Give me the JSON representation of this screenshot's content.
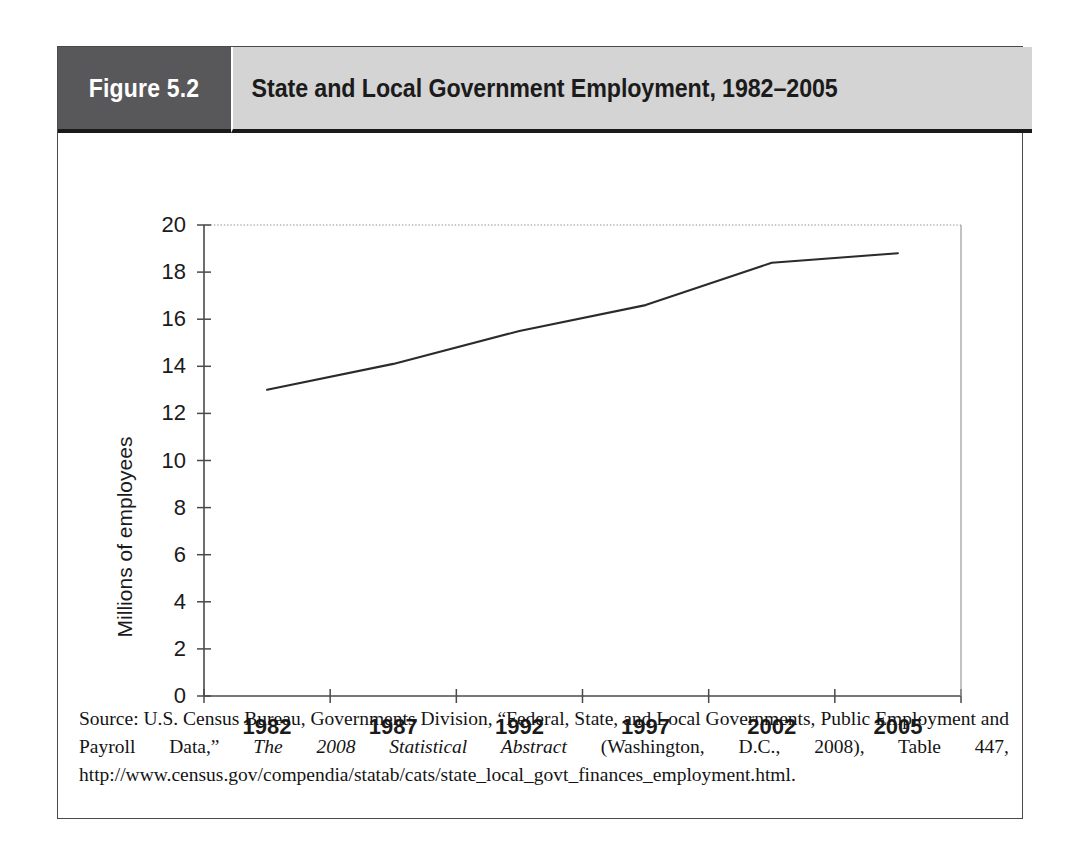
{
  "figure": {
    "number_label": "Figure 5.2",
    "title": "State and Local Government Employment, 1982–2005",
    "number_box_color": "#58585a",
    "title_box_color": "#d4d4d4",
    "frame_color": "#4a4a4a"
  },
  "source": {
    "prefix": "Source: U.S. Census Bureau, Governments Division, “Federal, State, and Local Governments, Public Employment and Payroll Data,” ",
    "italic_title": "The 2008 Statistical Abstract",
    "suffix": " (Washington, D.C., 2008), Table 447, http://www.census.gov/compendia/statab/cats/state_local_govt_finances_employment.html."
  },
  "chart_data": {
    "type": "line",
    "title": "State and Local Government Employment, 1982–2005",
    "xlabel": "",
    "ylabel": "Millions of employees",
    "ylim": [
      0,
      20
    ],
    "ytick_step": 2,
    "yticks": [
      "0",
      "2",
      "4",
      "6",
      "8",
      "10",
      "12",
      "14",
      "16",
      "18",
      "20"
    ],
    "categories": [
      "1982",
      "1987",
      "1992",
      "1997",
      "2002",
      "2005"
    ],
    "x": [
      1982,
      1987,
      1992,
      1997,
      2002,
      2005
    ],
    "values": [
      13.0,
      14.1,
      15.5,
      16.6,
      18.4,
      18.8
    ],
    "series": [
      {
        "name": "State and local government employment",
        "values": [
          13.0,
          14.1,
          15.5,
          16.6,
          18.4,
          18.8
        ]
      }
    ],
    "grid": "top-dotted-only",
    "legend": "none",
    "line_color": "#2b2b2b",
    "axis_color": "#4a4a4a"
  }
}
